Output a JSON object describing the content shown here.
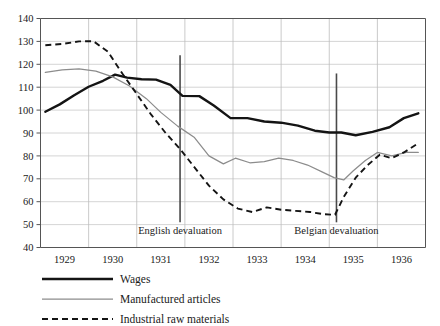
{
  "chart_data": {
    "type": "line",
    "title": "",
    "subtitle": "",
    "xlabel": "",
    "ylabel": "",
    "ylim": [
      40,
      140
    ],
    "xlim": [
      1928.5,
      1936.5
    ],
    "grid": true,
    "legend_position": "bottom-left",
    "y_ticks": [
      40,
      50,
      60,
      70,
      80,
      90,
      100,
      110,
      120,
      130,
      140
    ],
    "x_ticks": [
      1929,
      1930,
      1931,
      1932,
      1933,
      1934,
      1935,
      1936
    ],
    "x_tick_labels": [
      "1929",
      "1930",
      "1931",
      "1932",
      "1933",
      "1934",
      "1935",
      "1936"
    ],
    "y_tick_labels": [
      "40",
      "50",
      "60",
      "70",
      "80",
      "90",
      "100",
      "110",
      "120",
      "130",
      "140"
    ],
    "annotations": [
      {
        "label": "English devaluation",
        "x": 1931.4,
        "y_top": 124,
        "y_bottom": 51
      },
      {
        "label": "Belgian devaluation",
        "x": 1934.65,
        "y_top": 116,
        "y_bottom": 51
      }
    ],
    "series": [
      {
        "name": "Wages",
        "style": "solid-thick",
        "color": "#141414",
        "x": [
          1928.6,
          1928.9,
          1929.2,
          1929.5,
          1929.8,
          1930.05,
          1930.3,
          1930.6,
          1930.9,
          1931.2,
          1931.45,
          1931.8,
          1932.1,
          1932.45,
          1932.8,
          1933.15,
          1933.5,
          1933.85,
          1934.2,
          1934.5,
          1934.75,
          1935.05,
          1935.4,
          1935.75,
          1936.05,
          1936.35
        ],
        "y": [
          99.3,
          102.5,
          106.5,
          110.2,
          112.8,
          115.5,
          114.2,
          113.5,
          113.3,
          111.0,
          106.2,
          106.1,
          102.0,
          96.5,
          96.5,
          95.0,
          94.5,
          93.2,
          91.0,
          90.2,
          90.2,
          89.0,
          90.5,
          92.5,
          96.5,
          98.6
        ]
      },
      {
        "name": "Manufactured articles",
        "style": "solid-thin",
        "color": "#8c8c8c",
        "x": [
          1928.6,
          1928.95,
          1929.3,
          1929.65,
          1930.0,
          1930.35,
          1930.7,
          1931.0,
          1931.35,
          1931.7,
          1932.0,
          1932.3,
          1932.55,
          1932.85,
          1933.15,
          1933.45,
          1933.75,
          1934.05,
          1934.35,
          1934.6,
          1934.8,
          1935.0,
          1935.25,
          1935.5,
          1935.8,
          1936.1,
          1936.35
        ],
        "y": [
          116.5,
          117.6,
          118.0,
          117.0,
          114.5,
          110.5,
          105.0,
          99.0,
          93.0,
          88.0,
          80.0,
          76.5,
          79.0,
          77.0,
          77.5,
          79.0,
          78.0,
          76.0,
          73.0,
          70.5,
          69.5,
          73.5,
          78.0,
          81.5,
          80.0,
          81.5,
          81.5
        ]
      },
      {
        "name": "Industrial raw materials",
        "style": "dashed",
        "color": "#141414",
        "x": [
          1928.6,
          1928.95,
          1929.3,
          1929.6,
          1929.9,
          1930.2,
          1930.5,
          1930.8,
          1931.1,
          1931.4,
          1931.7,
          1932.0,
          1932.3,
          1932.6,
          1932.9,
          1933.2,
          1933.5,
          1933.8,
          1934.1,
          1934.4,
          1934.62,
          1934.8,
          1935.05,
          1935.3,
          1935.55,
          1935.8,
          1936.05,
          1936.35
        ],
        "y": [
          128.3,
          128.9,
          130.0,
          130.1,
          125.5,
          116.0,
          107.0,
          98.0,
          90.0,
          83.0,
          75.0,
          67.0,
          61.0,
          57.0,
          55.5,
          57.5,
          56.5,
          56.0,
          55.5,
          54.5,
          54.3,
          62.0,
          70.5,
          76.0,
          80.5,
          79.0,
          81.5,
          85.5
        ]
      }
    ],
    "legend": [
      {
        "label": "Wages",
        "style": "solid-thick"
      },
      {
        "label": "Manufactured articles",
        "style": "solid-thin"
      },
      {
        "label": "Industrial raw materials",
        "style": "dashed"
      }
    ]
  }
}
